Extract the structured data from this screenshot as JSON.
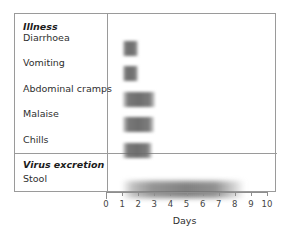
{
  "chart_data": {
    "type": "bar",
    "orientation": "horizontal",
    "title": "",
    "xlabel": "Days",
    "ylabel": "",
    "xlim": [
      0,
      10
    ],
    "xticks": [
      "0",
      "1",
      "2",
      "3",
      "4",
      "5",
      "6",
      "7",
      "8",
      "9",
      "10"
    ],
    "grid": false,
    "legend": null,
    "groups": [
      {
        "name": "Illness",
        "categories": [
          "Diarrhoea",
          "Vomiting",
          "Abdominal cramps",
          "Malaise",
          "Chills"
        ],
        "bars": [
          {
            "label": "Diarrhoea",
            "start": 1.0,
            "end": 1.9
          },
          {
            "label": "Vomiting",
            "start": 1.0,
            "end": 1.9
          },
          {
            "label": "Abdominal cramps",
            "start": 1.0,
            "end": 3.0
          },
          {
            "label": "Malaise",
            "start": 1.0,
            "end": 2.9
          },
          {
            "label": "Chills",
            "start": 1.0,
            "end": 2.8
          }
        ]
      },
      {
        "name": "Virus excretion",
        "categories": [
          "Stool"
        ],
        "bars": [
          {
            "label": "Stool",
            "start": 1.0,
            "end": 8.5,
            "soft": true
          }
        ]
      }
    ],
    "bar_color": "#6e6e6e",
    "frame_color": "#9a9a9a",
    "axis_color": "#8e8e8e"
  }
}
